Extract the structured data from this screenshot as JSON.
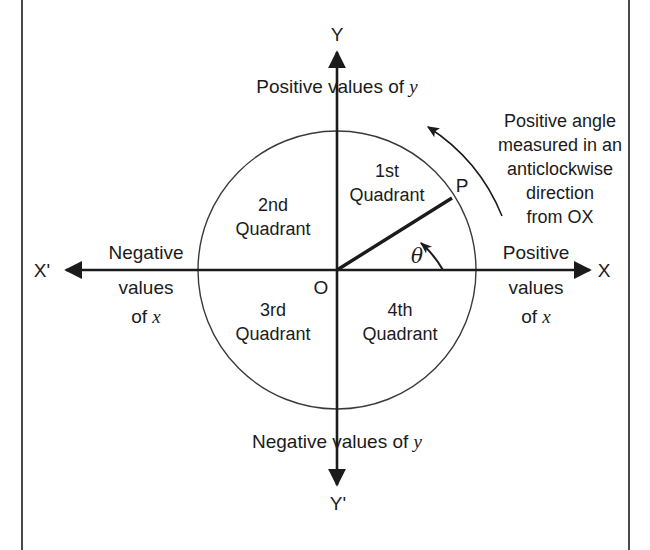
{
  "diagram": {
    "title_concept": "Quadrants and positive angle convention on the Cartesian plane",
    "axes": {
      "x_positive_label": "X",
      "x_negative_label": "X'",
      "y_positive_label": "Y",
      "y_negative_label": "Y'",
      "origin_label": "O"
    },
    "captions": {
      "positive_y": "Positive  values of y",
      "negative_y": "Negative  values of y",
      "positive_x_line1": "Positive",
      "positive_x_line2": "values",
      "positive_x_line3": "of x",
      "negative_x_line1": "Negative",
      "negative_x_line2": "values",
      "negative_x_line3": "of x"
    },
    "quadrants": [
      {
        "name": "first",
        "line1": "1st",
        "line2": "Quadrant"
      },
      {
        "name": "second",
        "line1": "2nd",
        "line2": "Quadrant"
      },
      {
        "name": "third",
        "line1": "3rd",
        "line2": "Quadrant"
      },
      {
        "name": "fourth",
        "line1": "4th",
        "line2": "Quadrant"
      }
    ],
    "point_label": "P",
    "angle_symbol": "θ",
    "annotation": {
      "line1": "Positive angle",
      "line2": "measured in an",
      "line3": "anticlockwise",
      "line4": "direction",
      "line5": "from OX"
    },
    "geometry": {
      "origin_x": 337,
      "origin_y": 270,
      "circle_radius": 139,
      "ray_angle_degrees": 32,
      "point_p_x": 452,
      "point_p_y": 198
    },
    "colors": {
      "ink": "#1b1b1b",
      "frame": "#4a4a4a",
      "circle_stroke": "#3a3a3a",
      "background": "#ffffff"
    }
  }
}
